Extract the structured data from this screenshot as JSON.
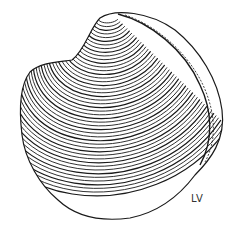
{
  "figure": {
    "view_label": "LV",
    "line_color": "#1a1a1a",
    "background": "#ffffff"
  }
}
